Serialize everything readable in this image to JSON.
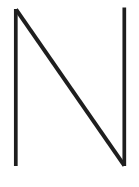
{
  "canvas": {
    "background_color": "#ffffff"
  },
  "letter": {
    "character": "N",
    "stroke_color": "#1e1e1e"
  }
}
